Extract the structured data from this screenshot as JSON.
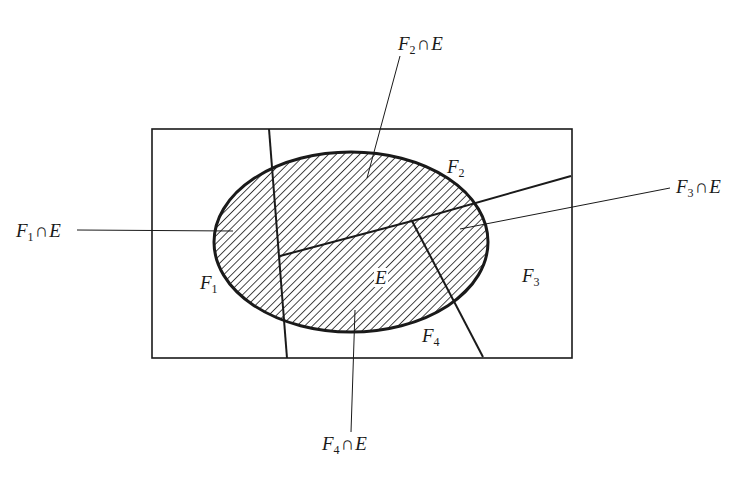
{
  "diagram": {
    "type": "venn-partition",
    "colors": {
      "stroke": "#1a1a1a",
      "background": "#ffffff",
      "hatch": "#1a1a1a"
    },
    "sample_space": {
      "x": 152,
      "y": 129,
      "width": 420,
      "height": 229
    },
    "ellipse_E": {
      "cx": 351,
      "cy": 242,
      "rx": 137,
      "ry": 90
    },
    "regions": [
      {
        "id": "F1",
        "symbol": "F",
        "sub": "1"
      },
      {
        "id": "F2",
        "symbol": "F",
        "sub": "2"
      },
      {
        "id": "F3",
        "symbol": "F",
        "sub": "3"
      },
      {
        "id": "F4",
        "symbol": "F",
        "sub": "4"
      }
    ],
    "set_label": "E",
    "intersection_labels": [
      {
        "id": "F1nE",
        "symbol": "F",
        "sub": "1",
        "op": "∩",
        "set": "E"
      },
      {
        "id": "F2nE",
        "symbol": "F",
        "sub": "2",
        "op": "∩",
        "set": "E"
      },
      {
        "id": "F3nE",
        "symbol": "F",
        "sub": "3",
        "op": "∩",
        "set": "E"
      },
      {
        "id": "F4nE",
        "symbol": "F",
        "sub": "4",
        "op": "∩",
        "set": "E"
      }
    ]
  }
}
